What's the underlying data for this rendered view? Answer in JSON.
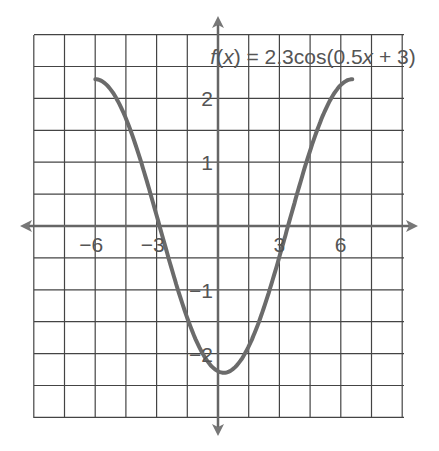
{
  "chart_data": {
    "type": "line",
    "title": "f(x) = 2.3cos(0.5x + 3)",
    "title_parts": {
      "f": "f",
      "open": "(",
      "x": "x",
      "rest": ") = 2.3cos(0.5",
      "x2": "x",
      "end": " + 3)"
    },
    "function": "2.3*cos(0.5*x+3)",
    "domain": [
      -6,
      6.566
    ],
    "xlabel": "",
    "ylabel": "",
    "x_ticks": [
      {
        "v": -6,
        "label": "−6"
      },
      {
        "v": -3,
        "label": "−3"
      },
      {
        "v": 3,
        "label": "3"
      },
      {
        "v": 6,
        "label": "6"
      }
    ],
    "y_ticks": [
      {
        "v": 2,
        "label": "2"
      },
      {
        "v": 1,
        "label": "1"
      },
      {
        "v": -1,
        "label": "−1"
      },
      {
        "v": -2,
        "label": "−2"
      }
    ],
    "x_grid_step": 1.5,
    "y_grid_step": 0.5,
    "xlim": [
      -9,
      9
    ],
    "ylim": [
      -3,
      3
    ],
    "grid": true,
    "legend": "none",
    "series": [
      {
        "name": "f(x)",
        "x": [
          -6,
          -4.5,
          -3,
          -1.5,
          0,
          1.5,
          3,
          4.5,
          6,
          6.566
        ],
        "values": [
          2.3,
          2.04,
          1.24,
          0.16,
          -0.93,
          -1.9,
          -2.28,
          -1.91,
          -0.96,
          2.3
        ]
      }
    ],
    "colors": {
      "curve": "#6b6b6b",
      "grid": "#444444",
      "axes": "#555555"
    }
  }
}
